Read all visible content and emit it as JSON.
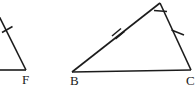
{
  "figure": {
    "type": "geometry-diagram",
    "width": 196,
    "height": 96,
    "background_color": "#ffffff",
    "stroke_color": "#1c1c1c",
    "label_color": "#1a1a1a",
    "shapes": [
      {
        "name": "left-triangle",
        "cropped": true,
        "vertices": [
          {
            "label": "",
            "x": -6,
            "y": 6
          },
          {
            "label": "",
            "x": -2,
            "y": 70
          },
          {
            "label": "F",
            "x": 26,
            "y": 70
          }
        ],
        "tick_marks": [
          {
            "side": "left-slanted-side",
            "count": 1,
            "x": 7,
            "y": 28
          }
        ]
      },
      {
        "name": "right-triangle",
        "cropped": false,
        "vertices": [
          {
            "label": "B",
            "x": 72,
            "y": 72
          },
          {
            "label": "C",
            "x": 191,
            "y": 70
          },
          {
            "label": "",
            "x": 160,
            "y": 3
          }
        ],
        "tick_marks": [
          {
            "side": "B-to-apex",
            "count": 2,
            "x": 119,
            "y": 33
          },
          {
            "side": "apex-to-C",
            "count": 1,
            "x": 178,
            "y": 33
          }
        ],
        "angle_markers": [
          {
            "at_vertex": "apex",
            "x": 160,
            "y": 3
          }
        ]
      }
    ],
    "labels": [
      {
        "id": "label-f",
        "text": "F",
        "x": 22,
        "y": 73
      },
      {
        "id": "label-b",
        "text": "B",
        "x": 70,
        "y": 74
      },
      {
        "id": "label-c",
        "text": "C",
        "x": 186,
        "y": 74
      }
    ]
  }
}
